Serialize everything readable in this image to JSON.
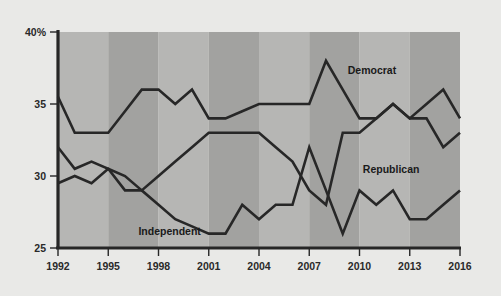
{
  "chart_data": {
    "type": "line",
    "title": "",
    "subtitle": "",
    "xlabel": "",
    "ylabel": "",
    "xlim": [
      1992,
      2016
    ],
    "ylim": [
      25,
      40
    ],
    "grid": false,
    "legend_position": "inline-annotations",
    "y_ticks": [
      "40%",
      "35",
      "30",
      "25"
    ],
    "y_tick_values": [
      40,
      35,
      30,
      25
    ],
    "x_ticks": [
      "1992",
      "1995",
      "1998",
      "2001",
      "2004",
      "2007",
      "2010",
      "2013",
      "2016"
    ],
    "x_tick_values": [
      1992,
      1995,
      1998,
      2001,
      2004,
      2007,
      2010,
      2013,
      2016
    ],
    "x": [
      1992,
      1993,
      1994,
      1995,
      1996,
      1997,
      1998,
      1999,
      2000,
      2001,
      2002,
      2003,
      2004,
      2005,
      2006,
      2007,
      2008,
      2009,
      2010,
      2011,
      2012,
      2013,
      2014,
      2015,
      2016
    ],
    "series": [
      {
        "name": "Democrat",
        "color": "#272727",
        "values": [
          35.5,
          33.0,
          33.0,
          33.0,
          34.5,
          36.0,
          36.0,
          35.0,
          36.0,
          34.0,
          34.0,
          34.5,
          35.0,
          35.0,
          35.0,
          35.0,
          38.0,
          36.0,
          34.0,
          34.0,
          35.0,
          34.0,
          35.0,
          36.0,
          34.0
        ]
      },
      {
        "name": "Republican",
        "color": "#272727",
        "values": [
          29.5,
          30.0,
          29.5,
          30.5,
          30.0,
          29.0,
          30.0,
          31.0,
          32.0,
          33.0,
          33.0,
          33.0,
          33.0,
          32.0,
          31.0,
          29.0,
          28.0,
          33.0,
          33.0,
          34.0,
          35.0,
          34.0,
          34.0,
          32.0,
          33.0
        ]
      },
      {
        "name": "Independent",
        "color": "#272727",
        "values": [
          32.0,
          30.5,
          31.0,
          30.5,
          29.0,
          29.0,
          28.0,
          27.0,
          26.5,
          26.0,
          26.0,
          28.0,
          27.0,
          28.0,
          28.0,
          32.0,
          29.0,
          26.0,
          29.0,
          28.0,
          29.0,
          27.0,
          27.0,
          28.0,
          29.0
        ]
      }
    ],
    "annotations": [
      {
        "text": "Democrat",
        "x": 2009.3,
        "y": 37.1
      },
      {
        "text": "Republican",
        "x": 2010.2,
        "y": 30.2
      },
      {
        "text": "Independent",
        "x": 1996.8,
        "y": 25.9
      }
    ],
    "bands": [
      {
        "from": 1992,
        "to": 1995,
        "shade": "light"
      },
      {
        "from": 1995,
        "to": 1998,
        "shade": "dark"
      },
      {
        "from": 1998,
        "to": 2001,
        "shade": "light"
      },
      {
        "from": 2001,
        "to": 2004,
        "shade": "dark"
      },
      {
        "from": 2004,
        "to": 2007,
        "shade": "light"
      },
      {
        "from": 2007,
        "to": 2010,
        "shade": "dark"
      },
      {
        "from": 2010,
        "to": 2013,
        "shade": "light"
      },
      {
        "from": 2013,
        "to": 2016,
        "shade": "dark"
      }
    ],
    "colors": {
      "background": "#e9e9e7",
      "band_light": "#b6b6b4",
      "band_dark": "#a2a2a0",
      "line": "#272727",
      "axis": "#262626",
      "text": "#2a2a2a"
    }
  }
}
